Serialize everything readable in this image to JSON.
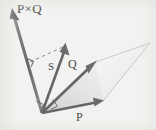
{
  "figure": {
    "background_color": "#f2f2f0",
    "stroke_color": "#6e6e6e",
    "label_color": "#4a4a4a",
    "fill_color": "#e9e9e7",
    "labels": {
      "cross_product": "P×Q",
      "area_vector": "S",
      "vector_q": "Q",
      "vector_p": "P"
    },
    "vectors": [
      {
        "name": "cross-product-vector",
        "label": "P×Q",
        "origin": [
          42,
          113
        ],
        "tip": [
          12,
          10
        ],
        "style": "solid-arrow"
      },
      {
        "name": "area-vector",
        "label": "S",
        "origin": [
          42,
          113
        ],
        "tip": [
          65,
          44
        ],
        "style": "solid-arrow"
      },
      {
        "name": "vector-q",
        "label": "Q",
        "origin": [
          42,
          113
        ],
        "tip": [
          96,
          62
        ],
        "style": "solid-arrow"
      },
      {
        "name": "vector-p",
        "label": "P",
        "origin": [
          42,
          113
        ],
        "tip": [
          103,
          101
        ],
        "style": "solid-arrow"
      }
    ],
    "parallelogram": {
      "name": "pq-parallelogram",
      "points": [
        [
          42,
          113
        ],
        [
          103,
          101
        ],
        [
          150,
          43
        ],
        [
          96,
          62
        ]
      ],
      "fill": "#eceae8"
    },
    "dashed_line": {
      "name": "perpendicular-guide",
      "from": [
        30,
        62
      ],
      "to": [
        65,
        46
      ]
    },
    "right_angle_markers": [
      {
        "name": "right-angle-upper",
        "at": [
          31,
          63
        ]
      },
      {
        "name": "right-angle-origin-left",
        "at": [
          42,
          106
        ]
      },
      {
        "name": "right-angle-origin-right",
        "at": [
          50,
          107
        ]
      }
    ]
  }
}
